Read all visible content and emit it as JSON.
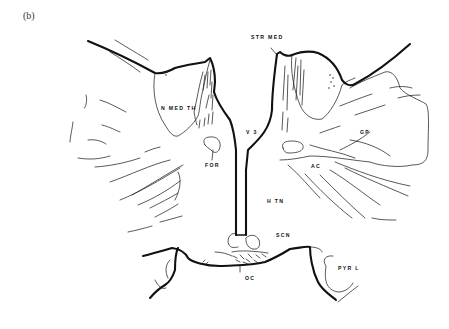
{
  "figure": {
    "panel_label": "(b)",
    "labels": {
      "str_med": "STR MED",
      "n_med_th": "N MED TH",
      "v3": "V 3",
      "gp": "GP",
      "for": "FOR",
      "ac": "AC",
      "htn": "H TN",
      "scn": "SCN",
      "oc": "OC",
      "pyr_l": "PYR L"
    },
    "colors": {
      "line": "#111111",
      "background": "#ffffff"
    }
  }
}
